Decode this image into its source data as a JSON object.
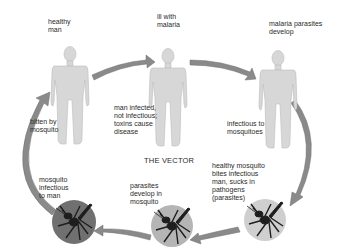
{
  "title": "THE VECTOR",
  "colors": {
    "background": "#ffffff",
    "figure_fill": "#d7d7d7",
    "figure_stroke": "#bcbcbc",
    "arrow_fill": "#8a8a8a",
    "arrow_stroke": "#6e6e6e",
    "circle_dark": "#707070",
    "circle_medium": "#b5b5b5",
    "circle_light": "#cfcfcf",
    "mosquito": "#1e1e1e",
    "text": "#2a2a2a"
  },
  "people": [
    {
      "id": "healthy-man",
      "label": "healthy\nman",
      "caption": "bitten by\nmosquito"
    },
    {
      "id": "ill-man",
      "label": "ill with\nmalaria",
      "caption": "man infected,\nnot infectious;\ntoxins cause\ndisease"
    },
    {
      "id": "developing-man",
      "label": "malaria parasites\ndevelop",
      "caption": "infectious to\nmosquitoes"
    }
  ],
  "mosquitoes": [
    {
      "id": "mosquito-infectious",
      "label": "mosquito\ninfectious\nto man",
      "shade": "dark"
    },
    {
      "id": "mosquito-developing",
      "label": "parasites\ndevelop in\nmosquito",
      "shade": "medium"
    },
    {
      "id": "mosquito-healthy",
      "label": "healthy mosquito\nbites infectious\nman, sucks in\npathogens\n(parasites)",
      "shade": "light"
    }
  ],
  "cycle_direction": "clockwise"
}
